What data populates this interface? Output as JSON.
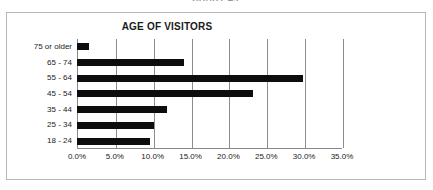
{
  "figure": {
    "caption": "CHART 4.2"
  },
  "chart_data": {
    "type": "bar",
    "orientation": "horizontal",
    "title": "AGE OF VISITORS",
    "xlabel": "",
    "ylabel": "",
    "categories": [
      "18 - 24",
      "25 - 34",
      "35 - 44",
      "45 - 54",
      "55 - 64",
      "65 - 74",
      "75 or older"
    ],
    "values": [
      9.7,
      10.2,
      11.9,
      23.3,
      29.9,
      14.1,
      1.6
    ],
    "value_labels": [
      "9.7%",
      "10.2%",
      "11.9%",
      "23.3%",
      "29.9%",
      "14.1%",
      "1.6%"
    ],
    "xlim": [
      0,
      35
    ],
    "xticks": [
      0,
      5,
      10,
      15,
      20,
      25,
      30,
      35
    ],
    "xtick_labels": [
      "0.0%",
      "5.0%",
      "10.0%",
      "15.0%",
      "20.0%",
      "25.0%",
      "30.0%",
      "35.0%"
    ],
    "grid": true,
    "legend": false,
    "bar_color": "#0d0d0d",
    "grid_color": "#8d8d8d",
    "axis_color": "#888888",
    "background": "#ffffff"
  }
}
